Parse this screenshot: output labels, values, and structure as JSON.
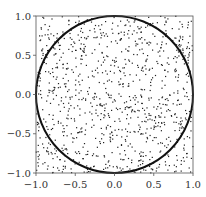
{
  "chart_data": {
    "type": "scatter",
    "title": "",
    "xlabel": "",
    "ylabel": "",
    "xlim": [
      -1.0,
      1.0
    ],
    "ylim": [
      -1.0,
      1.0
    ],
    "grid": false,
    "legend": null,
    "x_ticks": [
      "-1.0",
      "-0.5",
      "0.0",
      "0.5",
      "1.0"
    ],
    "y_ticks": [
      "-1.0",
      "-0.5",
      "0.0",
      "0.5",
      "1.0"
    ],
    "series": [
      {
        "name": "random points",
        "marker": "dot",
        "color": "#222222",
        "count_approx": 1000,
        "distribution": "uniform in [-1,1]x[-1,1]"
      },
      {
        "name": "unit circle",
        "type": "line",
        "color": "#111111",
        "center": [
          0,
          0
        ],
        "radius": 1.0
      }
    ],
    "aspect": "equal"
  }
}
